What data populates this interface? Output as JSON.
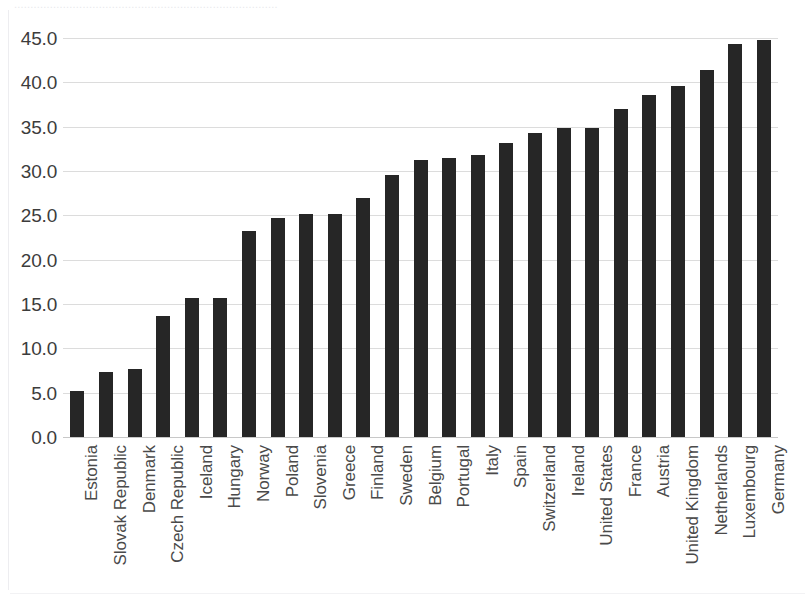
{
  "figure": {
    "background_color": "#ffffff",
    "bar_color": "#262626",
    "gridline_color": "#dcdcdc",
    "axis_color": "#c8c8c8",
    "tick_label_color": "#3c3c3c",
    "cropped_title_sliver": "................................................................................."
  },
  "chart_data": {
    "type": "bar",
    "title": "",
    "subtitle": "",
    "xlabel": "",
    "ylabel": "",
    "ylim": [
      0.0,
      45.0
    ],
    "y_tick_step": 5.0,
    "grid": true,
    "legend": "none",
    "orientation": "vertical",
    "sorted": "ascending",
    "y_ticks": [
      "0.0",
      "5.0",
      "10.0",
      "15.0",
      "20.0",
      "25.0",
      "30.0",
      "35.0",
      "40.0",
      "45.0"
    ],
    "y_tick_values": [
      0.0,
      5.0,
      10.0,
      15.0,
      20.0,
      25.0,
      30.0,
      35.0,
      40.0,
      45.0
    ],
    "categories": [
      "Estonia",
      "Slovak Republic",
      "Denmark",
      "Czech Republic",
      "Iceland",
      "Hungary",
      "Norway",
      "Poland",
      "Slovenia",
      "Greece",
      "Finland",
      "Sweden",
      "Belgium",
      "Portugal",
      "Italy",
      "Spain",
      "Switzerland",
      "Ireland",
      "United States",
      "France",
      "Austria",
      "United Kingdom",
      "Netherlands",
      "Luxembourg",
      "Germany"
    ],
    "values": [
      5.2,
      7.3,
      7.7,
      13.7,
      15.7,
      15.7,
      23.2,
      24.7,
      25.1,
      25.1,
      27.0,
      29.5,
      31.2,
      31.5,
      31.8,
      33.2,
      34.3,
      34.8,
      34.9,
      37.0,
      38.6,
      39.6,
      41.4,
      44.3,
      44.8
    ]
  }
}
